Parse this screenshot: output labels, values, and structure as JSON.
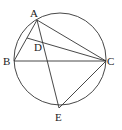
{
  "diagram": {
    "type": "geometry",
    "circle": {
      "cx": 60,
      "cy": 59,
      "r": 46
    },
    "points": {
      "A": {
        "x": 37,
        "y": 20,
        "label": "A"
      },
      "B": {
        "x": 14,
        "y": 61,
        "label": "B"
      },
      "C": {
        "x": 106,
        "y": 61,
        "label": "C"
      },
      "D": {
        "x": 27,
        "y": 38,
        "label": "D"
      },
      "E": {
        "x": 59,
        "y": 108,
        "label": "E"
      }
    },
    "segments": [
      "AB",
      "AC",
      "BC",
      "AE",
      "CE",
      "DC"
    ],
    "labels": {
      "A": "A",
      "B": "B",
      "C": "C",
      "D": "D",
      "E": "E"
    },
    "stroke_color": "#333333"
  }
}
